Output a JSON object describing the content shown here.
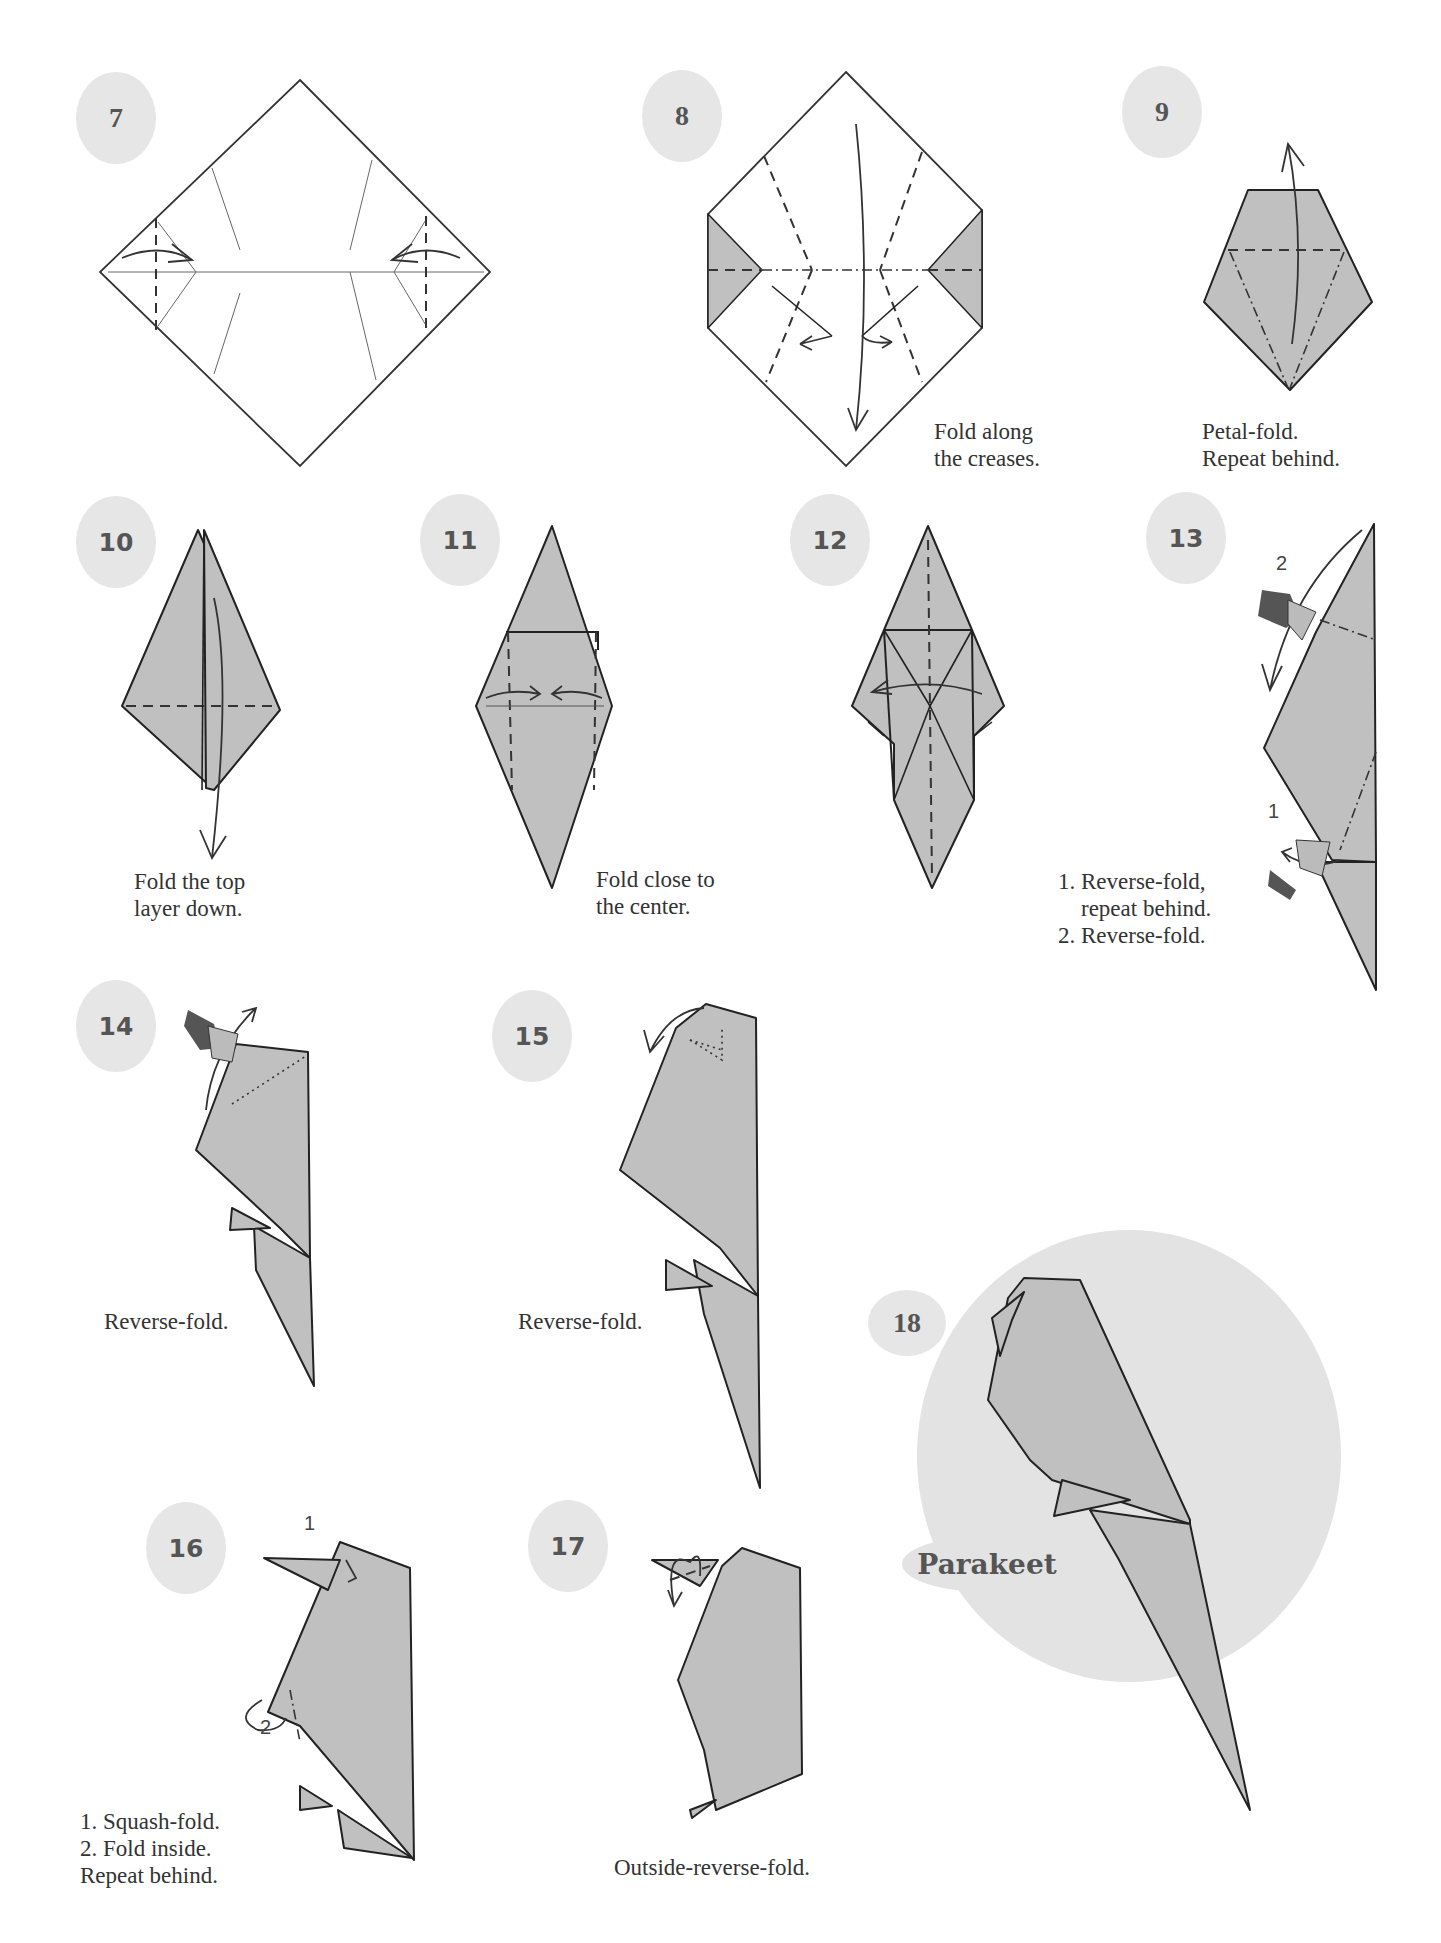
{
  "model_name": "Parakeet",
  "colors": {
    "paper_fill": "#c0c0c0",
    "badge_fill": "#e6e6e6",
    "final_circle_fill": "#e3e3e3",
    "line_color": "#222222"
  },
  "steps": [
    {
      "number": "7",
      "caption": ""
    },
    {
      "number": "8",
      "caption": "Fold along\nthe creases."
    },
    {
      "number": "9",
      "caption": "Petal-fold.\nRepeat behind."
    },
    {
      "number": "10",
      "caption": "Fold the top\nlayer down."
    },
    {
      "number": "11",
      "caption": "Fold close to\nthe center."
    },
    {
      "number": "12",
      "caption": ""
    },
    {
      "number": "13",
      "caption": "1. Reverse-fold,\n    repeat behind.\n2. Reverse-fold.",
      "labels": [
        "2",
        "1"
      ]
    },
    {
      "number": "14",
      "caption": "Reverse-fold."
    },
    {
      "number": "15",
      "caption": "Reverse-fold."
    },
    {
      "number": "16",
      "caption": "1. Squash-fold.\n2. Fold inside.\nRepeat behind.",
      "labels": [
        "1",
        "2"
      ]
    },
    {
      "number": "17",
      "caption": "Outside-reverse-fold."
    },
    {
      "number": "18",
      "caption": ""
    }
  ]
}
